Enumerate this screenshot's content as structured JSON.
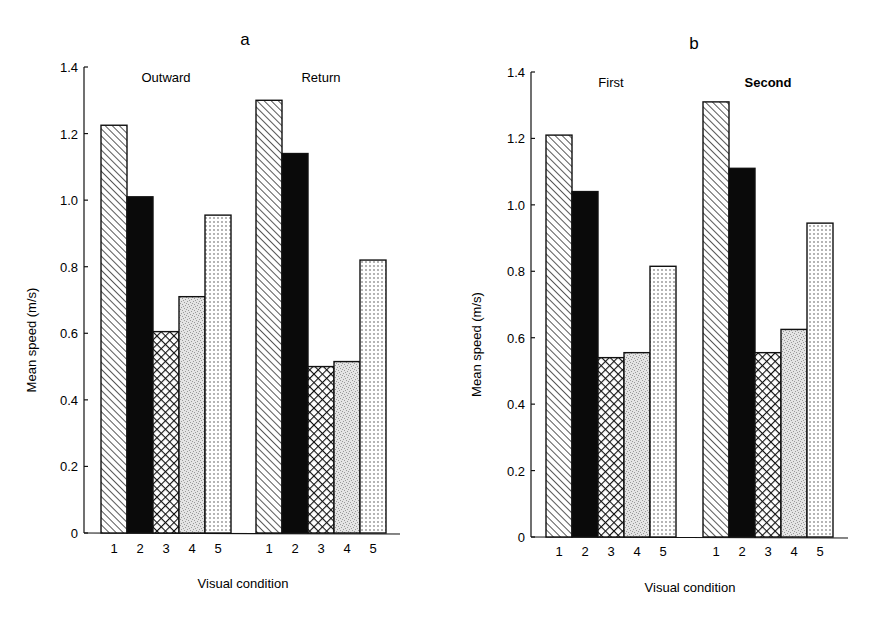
{
  "chart_data": [
    {
      "type": "bar",
      "panel": "a",
      "title": "a",
      "xlabel": "Visual condition",
      "ylabel": "Mean speed (m/s)",
      "ylim": [
        0,
        1.4
      ],
      "yticks": [
        0,
        0.2,
        0.4,
        0.6,
        0.8,
        1.0,
        1.2,
        1.4
      ],
      "ytick_labels": [
        "0",
        "0.2",
        "0.4",
        "0.6",
        "0.8",
        "1.0",
        "1.2",
        "1.4"
      ],
      "categories": [
        "1",
        "2",
        "3",
        "4",
        "5"
      ],
      "grid": false,
      "legend": "none; bar fill patterns denote visual condition 1-5 (hatched, solid black, crosshatch, stipple, dotted)",
      "series": [
        {
          "name": "Outward",
          "values": [
            1.225,
            1.01,
            0.605,
            0.71,
            0.955
          ]
        },
        {
          "name": "Return",
          "values": [
            1.3,
            1.14,
            0.5,
            0.515,
            0.82
          ]
        }
      ]
    },
    {
      "type": "bar",
      "panel": "b",
      "title": "b",
      "xlabel": "Visual condition",
      "ylabel": "Mean speed (m/s)",
      "ylim": [
        0,
        1.4
      ],
      "yticks": [
        0,
        0.2,
        0.4,
        0.6,
        0.8,
        1.0,
        1.2,
        1.4
      ],
      "ytick_labels": [
        "0",
        "0.2",
        "0.4",
        "0.6",
        "0.8",
        "1.0",
        "1.2",
        "1.4"
      ],
      "categories": [
        "1",
        "2",
        "3",
        "4",
        "5"
      ],
      "grid": false,
      "legend": "none; bar fill patterns denote visual condition 1-5 (hatched, solid black, crosshatch, stipple, dotted)",
      "series": [
        {
          "name": "First",
          "values": [
            1.21,
            1.04,
            0.54,
            0.555,
            0.815
          ]
        },
        {
          "name": "Second",
          "values": [
            1.31,
            1.11,
            0.555,
            0.625,
            0.945
          ]
        }
      ]
    }
  ]
}
